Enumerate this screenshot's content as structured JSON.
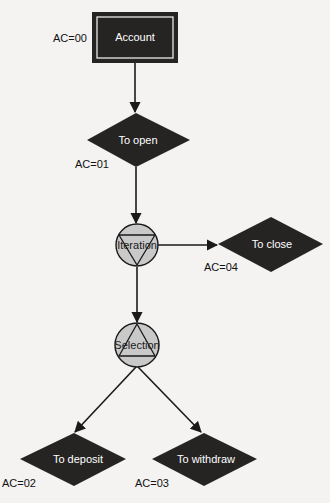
{
  "diagram": {
    "title": "Account",
    "colors": {
      "background": "#f4f3f1",
      "node_fill": "#252423",
      "node_text": "#ffffff",
      "control_fill": "#c9c9c9",
      "line": "#1a1a1a",
      "label_text": "#111111"
    },
    "nodes": [
      {
        "id": "account",
        "type": "root-rectangle",
        "label": "Account",
        "code": "AC=00"
      },
      {
        "id": "open",
        "type": "diamond",
        "label": "To open",
        "code": "AC=01"
      },
      {
        "id": "iteration",
        "type": "iteration-circle",
        "label": "Iteration"
      },
      {
        "id": "close",
        "type": "diamond",
        "label": "To close",
        "code": "AC=04"
      },
      {
        "id": "selection",
        "type": "selection-circle",
        "label": "Selection"
      },
      {
        "id": "deposit",
        "type": "diamond",
        "label": "To deposit",
        "code": "AC=02"
      },
      {
        "id": "withdraw",
        "type": "diamond",
        "label": "To withdraw",
        "code": "AC=03"
      }
    ],
    "edges": [
      {
        "from": "account",
        "to": "open"
      },
      {
        "from": "open",
        "to": "iteration"
      },
      {
        "from": "iteration",
        "to": "close"
      },
      {
        "from": "iteration",
        "to": "selection"
      },
      {
        "from": "selection",
        "to": "deposit"
      },
      {
        "from": "selection",
        "to": "withdraw"
      }
    ]
  }
}
